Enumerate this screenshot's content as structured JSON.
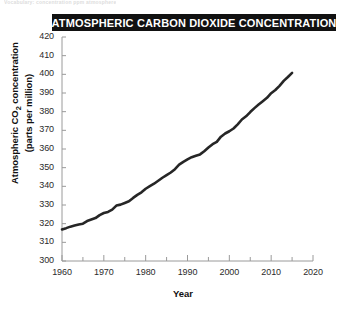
{
  "figure": {
    "top_artifact_text": "Vocabulary: concentration  ppm  atmosphere",
    "title": "ATMOSPHERIC CARBON DIOXIDE CONCENTRATION"
  },
  "chart_data": {
    "type": "line",
    "title": "ATMOSPHERIC CARBON DIOXIDE CONCENTRATION",
    "xlabel": "Year",
    "ylabel_line1": "Atmospheric CO",
    "ylabel_sub": "2",
    "ylabel_line1_rest": " concentration",
    "ylabel_line2": "(parts per million)",
    "xlim": [
      1960,
      2020
    ],
    "ylim": [
      300,
      420
    ],
    "x_major_step": 10,
    "x_minor_step": 5,
    "y_major_step": 10,
    "grid": false,
    "legend": "none",
    "line_color": "#262626",
    "line_width_px": 2.6,
    "x_ticks": [
      1960,
      1970,
      1980,
      1990,
      2000,
      2010,
      2020
    ],
    "y_ticks": [
      300,
      310,
      320,
      330,
      340,
      350,
      360,
      370,
      380,
      390,
      400,
      410,
      420
    ],
    "series": [
      {
        "name": "Atmospheric CO2 concentration (ppm)",
        "x": [
          1960,
          1961,
          1962,
          1963,
          1964,
          1965,
          1966,
          1967,
          1968,
          1969,
          1970,
          1971,
          1972,
          1973,
          1974,
          1975,
          1976,
          1977,
          1978,
          1979,
          1980,
          1981,
          1982,
          1983,
          1984,
          1985,
          1986,
          1987,
          1988,
          1989,
          1990,
          1991,
          1992,
          1993,
          1994,
          1995,
          1996,
          1997,
          1998,
          1999,
          2000,
          2001,
          2002,
          2003,
          2004,
          2005,
          2006,
          2007,
          2008,
          2009,
          2010,
          2011,
          2012,
          2013,
          2014,
          2015
        ],
        "values": [
          316.9,
          317.6,
          318.4,
          319.0,
          319.6,
          320.0,
          321.4,
          322.2,
          323.0,
          324.6,
          325.7,
          326.3,
          327.5,
          329.7,
          330.2,
          331.1,
          332.0,
          333.8,
          335.4,
          336.8,
          338.7,
          340.1,
          341.4,
          343.0,
          344.6,
          346.0,
          347.4,
          349.2,
          351.6,
          353.1,
          354.4,
          355.6,
          356.4,
          357.1,
          358.8,
          360.8,
          362.6,
          363.8,
          366.6,
          368.3,
          369.5,
          371.0,
          373.2,
          375.8,
          377.5,
          379.8,
          381.9,
          383.8,
          385.6,
          387.4,
          389.9,
          391.6,
          393.8,
          396.5,
          398.6,
          400.8
        ]
      }
    ]
  },
  "axes": {
    "x_tick_labels": [
      "1960",
      "1970",
      "1980",
      "1990",
      "2000",
      "2010",
      "2020"
    ],
    "y_tick_labels": [
      "420",
      "410",
      "400",
      "390",
      "380",
      "370",
      "360",
      "350",
      "340",
      "330",
      "320",
      "310",
      "300"
    ],
    "x_title": "Year",
    "y_title_line1_pre": "Atmospheric CO",
    "y_title_line1_sub": "2",
    "y_title_line1_post": " concentration",
    "y_title_line2": "(parts per million)"
  }
}
